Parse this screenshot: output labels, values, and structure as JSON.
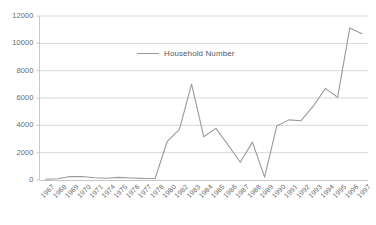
{
  "chart_data": {
    "type": "line",
    "title": "",
    "xlabel": "",
    "ylabel": "",
    "legend": [
      "Household Number"
    ],
    "legend_position": "inside-top-center",
    "grid": true,
    "grid_axis": "y",
    "ylim": [
      0,
      12000
    ],
    "yticks": [
      0,
      2000,
      4000,
      6000,
      8000,
      10000,
      12000
    ],
    "ytick_labels": [
      "0",
      "2000",
      "4000",
      "6000",
      "8000",
      "10000",
      "12000"
    ],
    "categories": [
      "1967",
      "1968",
      "1969",
      "1970",
      "1971",
      "1974",
      "1975",
      "1976",
      "1977",
      "1978",
      "1980",
      "1982",
      "1983",
      "1984",
      "1985",
      "1986",
      "1987",
      "1988",
      "1989",
      "1990",
      "1991",
      "1992",
      "1993",
      "1994",
      "1995",
      "1996",
      "1997"
    ],
    "series": [
      {
        "name": "Household Number",
        "color": "#9a9a9a",
        "values": [
          60,
          90,
          250,
          260,
          170,
          130,
          190,
          150,
          120,
          110,
          2820,
          3700,
          7010,
          3170,
          3780,
          2560,
          1300,
          2770,
          210,
          3950,
          4400,
          4340,
          5400,
          6700,
          6050,
          11120,
          10700
        ]
      }
    ]
  },
  "axis": {
    "line_color": "#c8c8c8",
    "grid_color": "#d9d9d9",
    "tick_text_color": "#6b6b6b"
  }
}
